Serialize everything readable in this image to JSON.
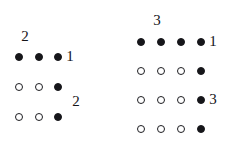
{
  "figure": {
    "background_color": "#ffffff",
    "filled_dot_color": "#16161a",
    "open_dot_color": "#1d1d21",
    "label_color": "#141418",
    "dot_diameter": 8,
    "groups": [
      {
        "id": "left-diagram",
        "name": "left-dot-diagram",
        "columns": 3,
        "rows": 3,
        "column_spacing": 19.5,
        "row_spacing": 30,
        "origin_x": 19,
        "origin_y": 57,
        "dots": [
          {
            "row": 0,
            "col": 0,
            "type": "filled"
          },
          {
            "row": 0,
            "col": 1,
            "type": "filled"
          },
          {
            "row": 0,
            "col": 2,
            "type": "filled"
          },
          {
            "row": 1,
            "col": 0,
            "type": "open"
          },
          {
            "row": 1,
            "col": 1,
            "type": "open"
          },
          {
            "row": 1,
            "col": 2,
            "type": "filled"
          },
          {
            "row": 2,
            "col": 0,
            "type": "open"
          },
          {
            "row": 2,
            "col": 1,
            "type": "open"
          },
          {
            "row": 2,
            "col": 2,
            "type": "filled"
          }
        ],
        "labels": [
          {
            "id": "left-top-label",
            "name": "left-column-count-label",
            "text": "2",
            "x": 25,
            "y": 37,
            "size": 15
          },
          {
            "id": "left-row-label-1",
            "name": "left-row-1-label",
            "text": "1",
            "x": 70,
            "y": 57,
            "size": 15
          },
          {
            "id": "left-row-label-2",
            "name": "left-row-2-label",
            "text": "2",
            "x": 76,
            "y": 102,
            "size": 15
          }
        ]
      },
      {
        "id": "right-diagram",
        "name": "right-dot-diagram",
        "columns": 4,
        "rows": 4,
        "column_spacing": 20,
        "row_spacing": 29,
        "origin_x": 141,
        "origin_y": 42,
        "dots": [
          {
            "row": 0,
            "col": 0,
            "type": "filled"
          },
          {
            "row": 0,
            "col": 1,
            "type": "filled"
          },
          {
            "row": 0,
            "col": 2,
            "type": "filled"
          },
          {
            "row": 0,
            "col": 3,
            "type": "filled"
          },
          {
            "row": 1,
            "col": 0,
            "type": "open"
          },
          {
            "row": 1,
            "col": 1,
            "type": "open"
          },
          {
            "row": 1,
            "col": 2,
            "type": "open"
          },
          {
            "row": 1,
            "col": 3,
            "type": "filled"
          },
          {
            "row": 2,
            "col": 0,
            "type": "open"
          },
          {
            "row": 2,
            "col": 1,
            "type": "open"
          },
          {
            "row": 2,
            "col": 2,
            "type": "open"
          },
          {
            "row": 2,
            "col": 3,
            "type": "filled"
          },
          {
            "row": 3,
            "col": 0,
            "type": "open"
          },
          {
            "row": 3,
            "col": 1,
            "type": "open"
          },
          {
            "row": 3,
            "col": 2,
            "type": "open"
          },
          {
            "row": 3,
            "col": 3,
            "type": "filled"
          }
        ],
        "labels": [
          {
            "id": "right-top-label",
            "name": "right-column-count-label",
            "text": "3",
            "x": 157,
            "y": 21,
            "size": 15
          },
          {
            "id": "right-row-label-1",
            "name": "right-row-1-label",
            "text": "1",
            "x": 213,
            "y": 42,
            "size": 15
          },
          {
            "id": "right-row-label-3",
            "name": "right-row-3-label",
            "text": "3",
            "x": 213,
            "y": 100,
            "size": 15
          }
        ]
      }
    ]
  }
}
